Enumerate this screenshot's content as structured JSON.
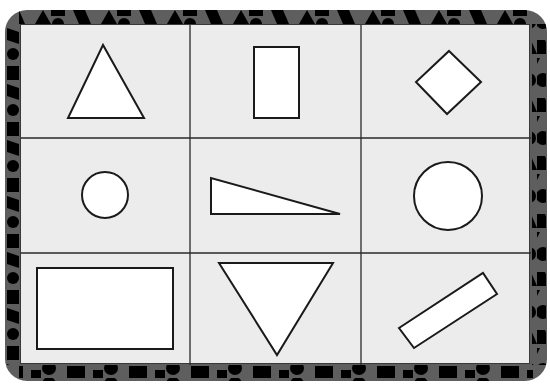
{
  "worksheet": {
    "layout": {
      "rows": 3,
      "cols": 3
    },
    "colors": {
      "border_background": "#5e5e5e",
      "border_pattern": "#000000",
      "panel_background": "#ececec",
      "grid_line": "#2a2a2a",
      "shape_fill": "#ffffff",
      "shape_stroke": "#1a1a1a"
    },
    "cells": [
      {
        "row": 0,
        "col": 0,
        "shape": "triangle"
      },
      {
        "row": 0,
        "col": 1,
        "shape": "rectangle-vertical"
      },
      {
        "row": 0,
        "col": 2,
        "shape": "diamond"
      },
      {
        "row": 1,
        "col": 0,
        "shape": "small-circle"
      },
      {
        "row": 1,
        "col": 1,
        "shape": "right-triangle"
      },
      {
        "row": 1,
        "col": 2,
        "shape": "large-circle"
      },
      {
        "row": 2,
        "col": 0,
        "shape": "rectangle-horizontal"
      },
      {
        "row": 2,
        "col": 1,
        "shape": "inverted-triangle"
      },
      {
        "row": 2,
        "col": 2,
        "shape": "rotated-rectangle"
      }
    ]
  }
}
